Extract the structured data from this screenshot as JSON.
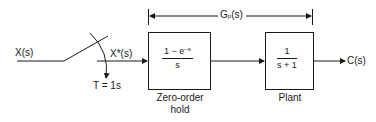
{
  "diagram": {
    "type": "sampled-data control block diagram",
    "input": {
      "label": "X(s)"
    },
    "sampler": {
      "output_label": "X*(s)",
      "period_label": "T = 1s"
    },
    "transfer_group": {
      "label": "G",
      "subscript": "p",
      "suffix": "(s)"
    },
    "blocks": [
      {
        "id": "zoh",
        "numerator": "1 − e",
        "numerator_exponent": "−s",
        "denominator": "s",
        "caption_line1": "Zero-order",
        "caption_line2": "hold"
      },
      {
        "id": "plant",
        "numerator": "1",
        "denominator": "s + 1",
        "caption_line1": "Plant"
      }
    ],
    "output": {
      "label": "C(s)"
    },
    "colors": {
      "stroke": "#1a1a1a",
      "background": "#ffffff"
    }
  }
}
